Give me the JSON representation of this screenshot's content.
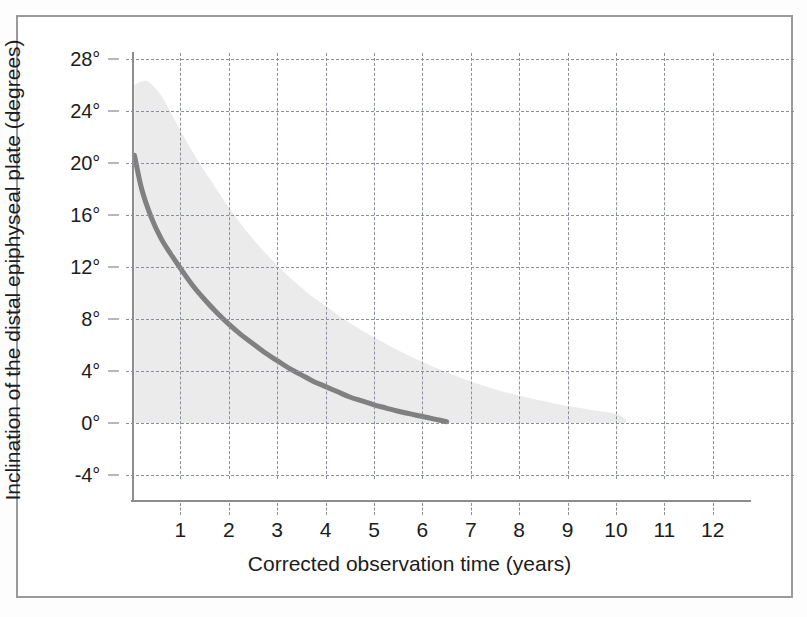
{
  "figure": {
    "background_color": "#ffffff",
    "frame_color": "#9a9a9a"
  },
  "chart_data": {
    "type": "line",
    "title": "",
    "subtitle": "",
    "xlabel": "Corrected observation time (years)",
    "ylabel": "Inclination of the distal epiphyseal plate (degrees)",
    "xlim": [
      0,
      13.6
    ],
    "ylim": [
      -4,
      28
    ],
    "xticks": [
      1,
      2,
      3,
      4,
      5,
      6,
      7,
      8,
      9,
      10,
      11,
      12
    ],
    "xtick_labels": [
      "1",
      "2",
      "3",
      "4",
      "5",
      "6",
      "7",
      "8",
      "9",
      "10",
      "11",
      "12"
    ],
    "yticks": [
      -4,
      0,
      4,
      8,
      12,
      16,
      20,
      24,
      28
    ],
    "ytick_labels": [
      "-4°",
      "0°",
      "4°",
      "8°",
      "12°",
      "16°",
      "20°",
      "24°",
      "28°"
    ],
    "grid": true,
    "grid_style": "dashed",
    "grid_color": "#8b8f99",
    "legend": false,
    "legend_position": "none",
    "series": [
      {
        "name": "Mean inclination",
        "type": "line",
        "color": "#808080",
        "line_width": 5,
        "x": [
          0.05,
          0.2,
          0.4,
          0.6,
          0.8,
          1.0,
          1.25,
          1.5,
          1.75,
          2.0,
          2.25,
          2.5,
          2.75,
          3.0,
          3.25,
          3.5,
          3.75,
          4.0,
          4.25,
          4.5,
          4.75,
          5.0,
          5.25,
          5.5,
          5.75,
          6.0,
          6.25,
          6.5
        ],
        "y": [
          20.6,
          18.0,
          15.8,
          14.2,
          13.0,
          11.9,
          10.6,
          9.5,
          8.5,
          7.6,
          6.8,
          6.1,
          5.4,
          4.8,
          4.2,
          3.7,
          3.2,
          2.8,
          2.4,
          2.0,
          1.7,
          1.4,
          1.15,
          0.9,
          0.7,
          0.5,
          0.3,
          0.1
        ]
      }
    ],
    "band": {
      "name": "Range / scatter band",
      "color": "#ebebeb",
      "lower_value": 0,
      "x": [
        0.05,
        0.3,
        0.6,
        0.9,
        1.2,
        1.6,
        2.0,
        2.4,
        2.8,
        3.2,
        3.6,
        4.0,
        4.5,
        5.0,
        5.5,
        6.0,
        6.5,
        7.0,
        7.5,
        8.0,
        8.5,
        9.0,
        9.5,
        10.0,
        10.2
      ],
      "upper": [
        26.0,
        26.3,
        25.2,
        23.2,
        21.2,
        18.8,
        16.6,
        14.6,
        12.9,
        11.4,
        10.1,
        9.0,
        7.7,
        6.6,
        5.6,
        4.7,
        3.9,
        3.2,
        2.6,
        2.1,
        1.7,
        1.3,
        1.0,
        0.7,
        0.3
      ]
    }
  }
}
